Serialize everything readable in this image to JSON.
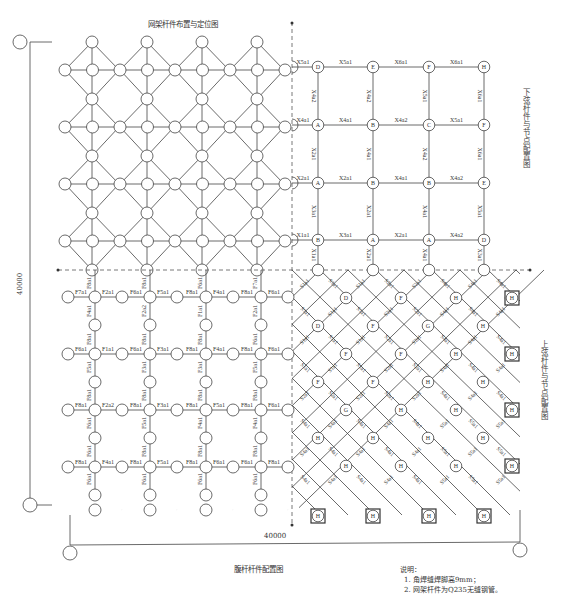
{
  "titles": {
    "grid_layout": "网架杆件布置与定位图",
    "lower_chord": "下弦杆件与节点配置图",
    "upper_chord": "上弦杆件与节点配置图",
    "web_members": "腹杆杆件配置图"
  },
  "dimensions": {
    "vertical": "40000",
    "horizontal": "40000"
  },
  "notes": {
    "heading": "说明：",
    "items": [
      "1. 角焊缝焊脚高9mm；",
      "2. 网架杆件为Q235无缝钢管。"
    ]
  },
  "colors": {
    "line": "#444444",
    "dashed_axis": "#555555",
    "background": "#ffffff"
  },
  "lower_chord": {
    "node_rows": [
      [
        "D",
        "E",
        "F",
        "H"
      ],
      [
        "A",
        "B",
        "C",
        "F"
      ],
      [
        "A",
        "B",
        "B",
        "E"
      ],
      [
        "B",
        "A",
        "A",
        "D"
      ]
    ],
    "horizontal_members": [
      [
        "X5a1",
        "X5a1",
        "X6a1",
        "X6a1"
      ],
      [
        "X4a1",
        "X4a1",
        "X4a2",
        "X5a1"
      ],
      [
        "X2a1",
        "X2a1",
        "X4a1",
        "X4a2"
      ],
      [
        "X1a1",
        "X3a1",
        "X2a1",
        "X4a2"
      ]
    ],
    "vertical_members": [
      [
        "X4a2",
        "X4a2",
        "X5a1",
        "X6a1"
      ],
      [
        "X2a1",
        "X4a1",
        "X4a2",
        "X6a1"
      ],
      [
        "X3a1",
        "X2a1",
        "X4a1",
        "X5a1"
      ],
      [
        "X1a1",
        "X2a1",
        "X4a1",
        "X3a1"
      ]
    ]
  },
  "upper_chord": {
    "node_rows": [
      [
        "D",
        "F",
        "H",
        "H"
      ],
      [
        "D",
        "F",
        "G",
        "H"
      ],
      [
        "F",
        "F",
        "H",
        "H"
      ],
      [
        "F",
        "F",
        "H",
        "H"
      ],
      [
        "G",
        "H",
        "H",
        "H"
      ],
      [
        "H",
        "H",
        "H",
        "H"
      ],
      [
        "H",
        "H",
        "H",
        "H"
      ]
    ],
    "edge_nodes_right": [
      "H",
      "H",
      "H",
      "H"
    ],
    "bottom_nodes": [
      "H",
      "H",
      "H",
      "H"
    ],
    "member_labels": [
      "S1a1",
      "S2a1",
      "S4a1",
      "S5a1",
      "S6a1"
    ]
  },
  "web_members": {
    "row_labels": [
      [
        "F7a1",
        "F2a1",
        "F6a1",
        "F5a1",
        "F8a1",
        "F4a1",
        "F8a1",
        "F6a1"
      ],
      [
        "F6a1",
        "F1a1",
        "F6a1",
        "F3a1",
        "F8a1",
        "F4a1",
        "F8a1",
        "F6a1"
      ],
      [
        "F8a1",
        "F2a2",
        "F8a1",
        "F3a1",
        "F8a1",
        "F5a1",
        "F8a1",
        "F6a1"
      ],
      [
        "F8a1",
        "F4a1",
        "F8a1",
        "F5a1",
        "F8a1",
        "F6a1",
        "F6a1",
        "F8a1"
      ]
    ],
    "col_labels": [
      [
        "F6a1",
        "F6a1",
        "F6a1",
        "F8a1",
        "F5a1",
        "F8a1",
        "F4a1",
        "F8a1"
      ],
      [
        "F6a1",
        "F8a1",
        "F5a1",
        "F8a1",
        "F3a1",
        "F8a1",
        "F2a2",
        "F8a1"
      ],
      [
        "F6a1",
        "F8a1",
        "F4a1",
        "F8a1",
        "F3a1",
        "F8a1",
        "F1a1",
        "F6a1"
      ],
      [
        "F6a1",
        "F8a1",
        "F4a1",
        "F8a1",
        "F5a1",
        "F6a1",
        "F2a1",
        "F7a1"
      ]
    ]
  }
}
